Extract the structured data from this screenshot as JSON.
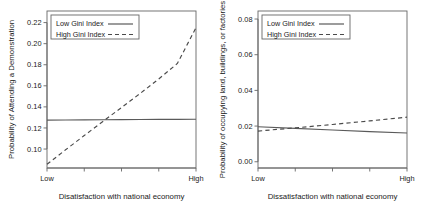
{
  "figure": {
    "panel_count": 2,
    "background_color": "#ffffff",
    "line_color_solid": "#5a5a5a",
    "line_color_dashed": "#4a4a4a",
    "axis_color": "#666666"
  },
  "chart_data": [
    {
      "type": "line",
      "panel": "left",
      "title": "",
      "xlabel": "Disatisfaction with national economy",
      "ylabel": "Probability of Attending a Demonstration",
      "xlim": [
        0,
        1
      ],
      "ylim": [
        0.082,
        0.231
      ],
      "grid": false,
      "legend_position": "top-left",
      "xticks": [
        0,
        0.25,
        0.5,
        0.75,
        1
      ],
      "xticklabels": [
        "Low",
        "",
        "",
        "",
        "High"
      ],
      "yticks": [
        0.1,
        0.12,
        0.14,
        0.16,
        0.18,
        0.2,
        0.22
      ],
      "yticklabels": [
        "0.10",
        "0.12",
        "0.14",
        "0.16",
        "0.18",
        "0.20",
        "0.22"
      ],
      "x": [
        0,
        0.125,
        0.25,
        0.375,
        0.5,
        0.625,
        0.75,
        0.875,
        1
      ],
      "series": [
        {
          "name": "Low Gini Index",
          "style": "solid",
          "values": [
            0.1275,
            0.1276,
            0.1277,
            0.1278,
            0.1279,
            0.128,
            0.1281,
            0.1282,
            0.1283
          ]
        },
        {
          "name": "High Gini Index",
          "style": "dashed",
          "values": [
            0.0855,
            0.0993,
            0.1128,
            0.1262,
            0.1394,
            0.1527,
            0.1665,
            0.1812,
            0.2152
          ]
        }
      ]
    },
    {
      "type": "line",
      "panel": "right",
      "title": "",
      "xlabel": "Dissatisfaction with national economy",
      "ylabel": "Probability of occupying land, buildings, or factories",
      "xlim": [
        0,
        1
      ],
      "ylim": [
        -0.0035,
        0.0845
      ],
      "grid": false,
      "legend_position": "top-left",
      "xticks": [
        0,
        0.25,
        0.5,
        0.75,
        1
      ],
      "xticklabels": [
        "Low",
        "",
        "",
        "",
        "High"
      ],
      "yticks": [
        0.0,
        0.02,
        0.04,
        0.06,
        0.08
      ],
      "yticklabels": [
        "0.00",
        "0.02",
        "0.04",
        "0.06",
        "0.08"
      ],
      "x": [
        0,
        0.25,
        0.5,
        0.75,
        1
      ],
      "series": [
        {
          "name": "Low Gini Index",
          "style": "solid",
          "values": [
            0.0196,
            0.0187,
            0.0178,
            0.0169,
            0.0161
          ]
        },
        {
          "name": "High Gini Index",
          "style": "dashed",
          "values": [
            0.0172,
            0.019,
            0.0209,
            0.0229,
            0.025
          ]
        }
      ]
    }
  ],
  "legend": {
    "entries": [
      {
        "label": "Low Gini Index",
        "style": "solid"
      },
      {
        "label": "High Gini Index",
        "style": "dashed"
      }
    ]
  }
}
